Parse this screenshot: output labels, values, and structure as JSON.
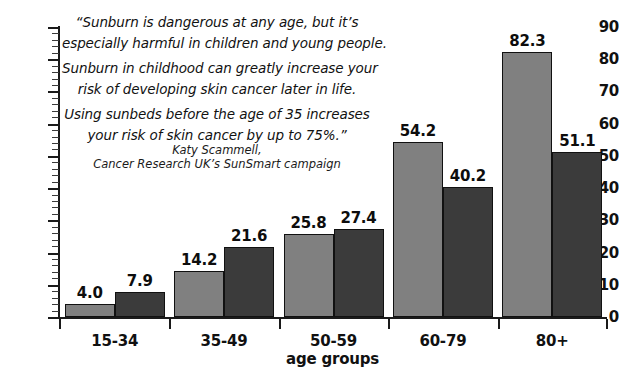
{
  "chart_data": {
    "type": "bar",
    "title": "",
    "xlabel": "age groups",
    "ylabel": "",
    "ylim": [
      0,
      90
    ],
    "ytick_step": 10,
    "yticks": [
      0,
      10,
      20,
      30,
      40,
      50,
      60,
      70,
      80,
      90
    ],
    "minor_tick_step": 2,
    "grid": false,
    "legend": "none",
    "categories": [
      "15-34",
      "35-49",
      "50-59",
      "60-79",
      "80+"
    ],
    "series": [
      {
        "name": "series-a",
        "color": "#808080",
        "values": [
          4.0,
          14.2,
          25.8,
          54.2,
          82.3
        ],
        "labels": [
          "4.0",
          "14.2",
          "25.8",
          "54.2",
          "82.3"
        ]
      },
      {
        "name": "series-b",
        "color": "#3b3b3b",
        "values": [
          7.9,
          21.6,
          27.4,
          40.2,
          51.1
        ],
        "labels": [
          "7.9",
          "21.6",
          "27.4",
          "40.2",
          "51.1"
        ]
      }
    ]
  },
  "annotation": {
    "quote_lines": [
      "“Sunburn is dangerous at any age, but it’s",
      "especially harmful in children and young people.",
      "Sunburn in childhood can greatly increase your",
      "risk of developing skin cancer later in life.",
      "Using sunbeds before the age of 35 increases",
      "your risk of skin cancer by up to 75%.”"
    ],
    "attribution_lines": [
      "Katy Scammell,",
      "Cancer Research UK’s SunSmart campaign"
    ]
  },
  "colors": {
    "series_a": "#808080",
    "series_b": "#3b3b3b",
    "axis": "#1a1a1a",
    "text": "#111111",
    "background": "#ffffff"
  }
}
